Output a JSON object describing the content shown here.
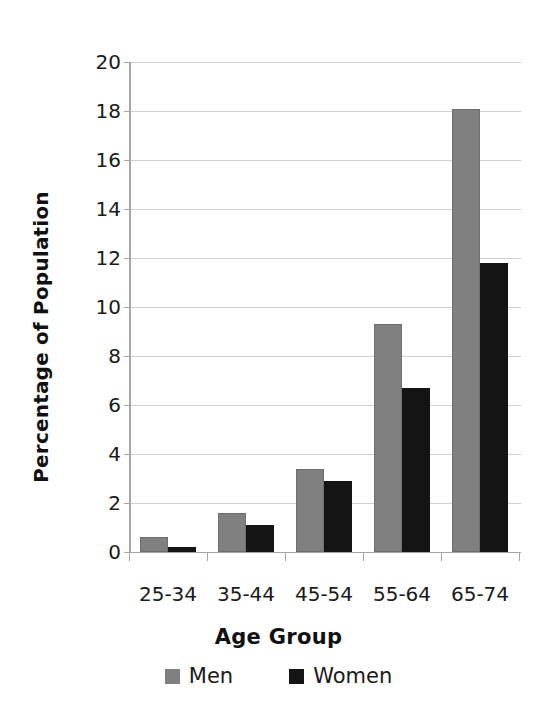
{
  "chart_data": {
    "type": "bar",
    "title": "",
    "xlabel": "Age Group",
    "ylabel": "Percentage of Population",
    "categories": [
      "25-34",
      "35-44",
      "45-54",
      "55-64",
      "65-74"
    ],
    "series": [
      {
        "name": "Men",
        "color": "#808080",
        "values": [
          0.6,
          1.6,
          3.4,
          9.3,
          18.1
        ]
      },
      {
        "name": "Women",
        "color": "#141414",
        "values": [
          0.2,
          1.1,
          2.9,
          6.7,
          11.8
        ]
      }
    ],
    "ylim": [
      0,
      20
    ],
    "ytick_labels": [
      "20",
      "18",
      "16",
      "14",
      "12",
      "10",
      "8",
      "6",
      "4",
      "2",
      "0"
    ],
    "ytick_values": [
      20,
      18,
      16,
      14,
      12,
      10,
      8,
      6,
      4,
      2,
      0
    ],
    "grid": "horizontal",
    "legend_position": "bottom",
    "legend_entries": [
      "Men",
      "Women"
    ]
  },
  "figure": {
    "top_cut_text": ""
  }
}
